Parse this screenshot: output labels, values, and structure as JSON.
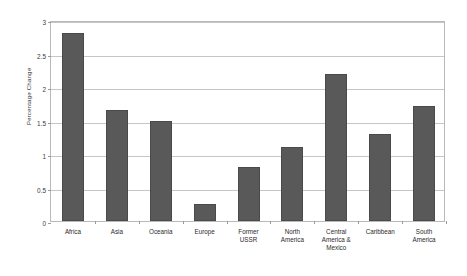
{
  "chart_data": {
    "type": "bar",
    "title": "",
    "subtitle": "",
    "xlabel": "",
    "ylabel": "Percentage Change",
    "categories": [
      "Africa",
      "Asia",
      "Oceania",
      "Europe",
      "Former\nUSSR",
      "North\nAmerica",
      "Central\nAmerica &\nMexico",
      "Caribbean",
      "South\nAmerica"
    ],
    "values": [
      2.8,
      1.65,
      1.5,
      0.25,
      0.8,
      1.1,
      2.2,
      1.3,
      1.72
    ],
    "ylim": [
      0,
      3
    ],
    "ytick_labels": [
      "0",
      "0.5",
      "1",
      "1.5",
      "2",
      "2.5",
      "3"
    ],
    "ytick_values": [
      0,
      0.5,
      1,
      1.5,
      2,
      2.5,
      3
    ],
    "grid": true,
    "grid_axis": "y",
    "legend": false,
    "legend_position": "none",
    "bar_color": "#595959",
    "grid_color": "#c6c6c6",
    "axis_color": "#b9b9b9",
    "background_color": "#ffffff"
  }
}
